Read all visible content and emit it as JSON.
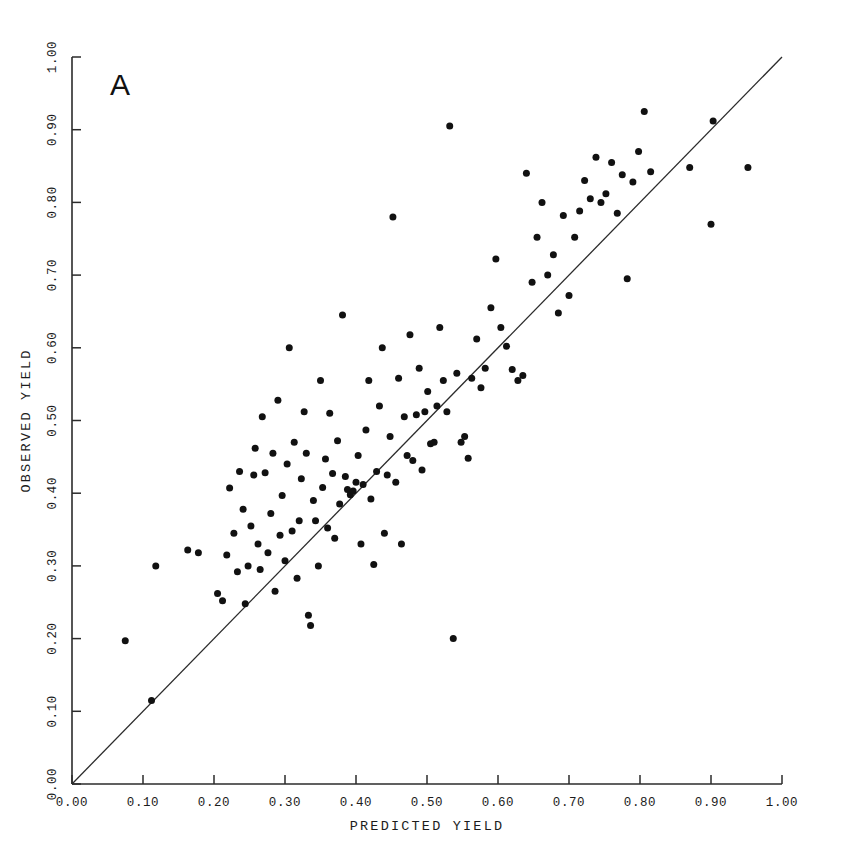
{
  "figure": {
    "panel_label": "A",
    "background_color": "#ffffff",
    "ink_color": "#1c1c1c"
  },
  "chart_data": {
    "type": "scatter",
    "title": "",
    "panel": "A",
    "xlabel": "PREDICTED YIELD",
    "ylabel": "OBSERVED YIELD",
    "xlim": [
      0.0,
      1.0
    ],
    "ylim": [
      0.0,
      1.0
    ],
    "grid": false,
    "legend": null,
    "xticks": [
      0.0,
      0.1,
      0.2,
      0.3,
      0.4,
      0.5,
      0.6,
      0.7,
      0.8,
      0.9,
      1.0
    ],
    "yticks": [
      0.0,
      0.1,
      0.2,
      0.3,
      0.4,
      0.5,
      0.6,
      0.7,
      0.8,
      0.9,
      1.0
    ],
    "xticklabels": [
      "0.00",
      "0.10",
      "0.20",
      "0.30",
      "0.40",
      "0.50",
      "0.60",
      "0.70",
      "0.80",
      "0.90",
      "1.00"
    ],
    "yticklabels": [
      "0.00",
      "0.10",
      "0.20",
      "0.30",
      "0.40",
      "0.50",
      "0.60",
      "0.70",
      "0.80",
      "0.90",
      "1.00"
    ],
    "ytick_label_rotation": 90,
    "ylabel_rotation": 90,
    "reference_line": {
      "name": "one-to-one-line",
      "equation": "y = x",
      "from": [
        0.0,
        0.0
      ],
      "to": [
        1.0,
        1.0
      ],
      "color": "#2b2b2b"
    },
    "marker": {
      "shape": "circle",
      "size": 4.6,
      "color": "#111111"
    },
    "n_points": 131,
    "points": [
      [
        0.075,
        0.197
      ],
      [
        0.112,
        0.115
      ],
      [
        0.118,
        0.3
      ],
      [
        0.163,
        0.322
      ],
      [
        0.178,
        0.318
      ],
      [
        0.205,
        0.262
      ],
      [
        0.212,
        0.252
      ],
      [
        0.218,
        0.315
      ],
      [
        0.222,
        0.407
      ],
      [
        0.228,
        0.345
      ],
      [
        0.233,
        0.292
      ],
      [
        0.236,
        0.43
      ],
      [
        0.241,
        0.378
      ],
      [
        0.244,
        0.248
      ],
      [
        0.248,
        0.3
      ],
      [
        0.252,
        0.355
      ],
      [
        0.256,
        0.425
      ],
      [
        0.258,
        0.462
      ],
      [
        0.262,
        0.33
      ],
      [
        0.265,
        0.295
      ],
      [
        0.268,
        0.505
      ],
      [
        0.272,
        0.428
      ],
      [
        0.276,
        0.318
      ],
      [
        0.28,
        0.372
      ],
      [
        0.283,
        0.455
      ],
      [
        0.286,
        0.265
      ],
      [
        0.29,
        0.528
      ],
      [
        0.293,
        0.342
      ],
      [
        0.296,
        0.397
      ],
      [
        0.3,
        0.307
      ],
      [
        0.303,
        0.44
      ],
      [
        0.306,
        0.6
      ],
      [
        0.31,
        0.348
      ],
      [
        0.313,
        0.47
      ],
      [
        0.317,
        0.283
      ],
      [
        0.32,
        0.362
      ],
      [
        0.323,
        0.42
      ],
      [
        0.327,
        0.512
      ],
      [
        0.33,
        0.455
      ],
      [
        0.333,
        0.232
      ],
      [
        0.336,
        0.218
      ],
      [
        0.34,
        0.39
      ],
      [
        0.343,
        0.362
      ],
      [
        0.347,
        0.3
      ],
      [
        0.35,
        0.555
      ],
      [
        0.353,
        0.408
      ],
      [
        0.357,
        0.447
      ],
      [
        0.36,
        0.352
      ],
      [
        0.363,
        0.51
      ],
      [
        0.367,
        0.427
      ],
      [
        0.37,
        0.338
      ],
      [
        0.374,
        0.472
      ],
      [
        0.377,
        0.385
      ],
      [
        0.381,
        0.645
      ],
      [
        0.385,
        0.423
      ],
      [
        0.388,
        0.405
      ],
      [
        0.392,
        0.398
      ],
      [
        0.396,
        0.403
      ],
      [
        0.4,
        0.415
      ],
      [
        0.403,
        0.452
      ],
      [
        0.407,
        0.33
      ],
      [
        0.41,
        0.412
      ],
      [
        0.414,
        0.487
      ],
      [
        0.418,
        0.555
      ],
      [
        0.421,
        0.392
      ],
      [
        0.425,
        0.302
      ],
      [
        0.429,
        0.43
      ],
      [
        0.433,
        0.52
      ],
      [
        0.437,
        0.6
      ],
      [
        0.44,
        0.345
      ],
      [
        0.444,
        0.425
      ],
      [
        0.448,
        0.478
      ],
      [
        0.452,
        0.78
      ],
      [
        0.456,
        0.415
      ],
      [
        0.46,
        0.558
      ],
      [
        0.464,
        0.33
      ],
      [
        0.468,
        0.505
      ],
      [
        0.472,
        0.452
      ],
      [
        0.476,
        0.618
      ],
      [
        0.48,
        0.445
      ],
      [
        0.485,
        0.508
      ],
      [
        0.489,
        0.572
      ],
      [
        0.493,
        0.432
      ],
      [
        0.497,
        0.512
      ],
      [
        0.501,
        0.54
      ],
      [
        0.505,
        0.468
      ],
      [
        0.51,
        0.47
      ],
      [
        0.514,
        0.52
      ],
      [
        0.518,
        0.628
      ],
      [
        0.523,
        0.555
      ],
      [
        0.528,
        0.512
      ],
      [
        0.532,
        0.905
      ],
      [
        0.537,
        0.2
      ],
      [
        0.542,
        0.565
      ],
      [
        0.548,
        0.47
      ],
      [
        0.553,
        0.478
      ],
      [
        0.558,
        0.448
      ],
      [
        0.563,
        0.558
      ],
      [
        0.57,
        0.612
      ],
      [
        0.576,
        0.545
      ],
      [
        0.582,
        0.572
      ],
      [
        0.59,
        0.655
      ],
      [
        0.597,
        0.722
      ],
      [
        0.604,
        0.628
      ],
      [
        0.612,
        0.602
      ],
      [
        0.62,
        0.57
      ],
      [
        0.628,
        0.555
      ],
      [
        0.635,
        0.562
      ],
      [
        0.64,
        0.84
      ],
      [
        0.648,
        0.69
      ],
      [
        0.655,
        0.752
      ],
      [
        0.662,
        0.8
      ],
      [
        0.67,
        0.7
      ],
      [
        0.678,
        0.728
      ],
      [
        0.685,
        0.648
      ],
      [
        0.692,
        0.782
      ],
      [
        0.7,
        0.672
      ],
      [
        0.708,
        0.752
      ],
      [
        0.715,
        0.788
      ],
      [
        0.722,
        0.83
      ],
      [
        0.73,
        0.805
      ],
      [
        0.738,
        0.862
      ],
      [
        0.745,
        0.8
      ],
      [
        0.752,
        0.812
      ],
      [
        0.76,
        0.855
      ],
      [
        0.768,
        0.785
      ],
      [
        0.775,
        0.838
      ],
      [
        0.782,
        0.695
      ],
      [
        0.79,
        0.828
      ],
      [
        0.798,
        0.87
      ],
      [
        0.806,
        0.925
      ],
      [
        0.815,
        0.842
      ],
      [
        0.87,
        0.848
      ],
      [
        0.9,
        0.77
      ],
      [
        0.903,
        0.912
      ],
      [
        0.952,
        0.848
      ]
    ]
  }
}
